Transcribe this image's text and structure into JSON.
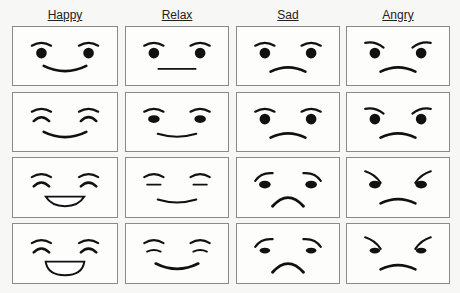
{
  "columns": [
    {
      "label": "Happy",
      "key": "happy"
    },
    {
      "label": "Relax",
      "key": "relax"
    },
    {
      "label": "Sad",
      "key": "sad"
    },
    {
      "label": "Angry",
      "key": "angry"
    }
  ],
  "rows": 4,
  "colors": {
    "ink": "#111111",
    "border": "#8a8a8a",
    "background": "#fdfdfc"
  },
  "faces": [
    [
      {
        "emotion": "happy",
        "level": 1,
        "eyes": "dot",
        "brows": "arch",
        "mouth": "smile"
      },
      {
        "emotion": "relax",
        "level": 1,
        "eyes": "dot",
        "brows": "arch",
        "mouth": "flat"
      },
      {
        "emotion": "sad",
        "level": 1,
        "eyes": "dot",
        "brows": "arch",
        "mouth": "frown"
      },
      {
        "emotion": "angry",
        "level": 1,
        "eyes": "dot",
        "brows": "slant-in",
        "mouth": "frown"
      }
    ],
    [
      {
        "emotion": "happy",
        "level": 2,
        "eyes": "closed-arc",
        "brows": "arch",
        "mouth": "smile"
      },
      {
        "emotion": "relax",
        "level": 2,
        "eyes": "oval",
        "brows": "arch",
        "mouth": "slight-smile"
      },
      {
        "emotion": "sad",
        "level": 2,
        "eyes": "dot",
        "brows": "arch",
        "mouth": "frown"
      },
      {
        "emotion": "angry",
        "level": 2,
        "eyes": "dot",
        "brows": "slant-in",
        "mouth": "frown"
      }
    ],
    [
      {
        "emotion": "happy",
        "level": 3,
        "eyes": "closed-arc",
        "brows": "arch",
        "mouth": "open-smile"
      },
      {
        "emotion": "relax",
        "level": 3,
        "eyes": "line",
        "brows": "arch",
        "mouth": "slight-smile"
      },
      {
        "emotion": "sad",
        "level": 3,
        "eyes": "oval",
        "brows": "arch-up",
        "mouth": "deep-frown"
      },
      {
        "emotion": "angry",
        "level": 3,
        "eyes": "oval",
        "brows": "steep-in",
        "mouth": "frown"
      }
    ],
    [
      {
        "emotion": "happy",
        "level": 4,
        "eyes": "closed-arc",
        "brows": "arch",
        "mouth": "big-open-smile"
      },
      {
        "emotion": "relax",
        "level": 4,
        "eyes": "line-tilt",
        "brows": "arch",
        "mouth": "smile"
      },
      {
        "emotion": "sad",
        "level": 4,
        "eyes": "oval-small",
        "brows": "arch-up",
        "mouth": "deep-frown"
      },
      {
        "emotion": "angry",
        "level": 4,
        "eyes": "oval-small",
        "brows": "steep-in",
        "mouth": "frown"
      }
    ]
  ]
}
